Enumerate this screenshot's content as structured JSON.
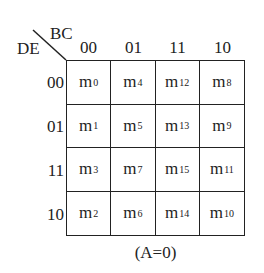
{
  "kmap": {
    "row_variable": "DE",
    "col_variable": "BC",
    "col_headers": [
      "00",
      "01",
      "11",
      "10"
    ],
    "row_headers": [
      "00",
      "01",
      "11",
      "10"
    ],
    "cells": [
      [
        {
          "base": "m",
          "sub": "0"
        },
        {
          "base": "m",
          "sub": "4"
        },
        {
          "base": "m",
          "sub": "12"
        },
        {
          "base": "m",
          "sub": "8"
        }
      ],
      [
        {
          "base": "m",
          "sub": "1"
        },
        {
          "base": "m",
          "sub": "5"
        },
        {
          "base": "m",
          "sub": "13"
        },
        {
          "base": "m",
          "sub": "9"
        }
      ],
      [
        {
          "base": "m",
          "sub": "3"
        },
        {
          "base": "m",
          "sub": "7"
        },
        {
          "base": "m",
          "sub": "15"
        },
        {
          "base": "m",
          "sub": "11"
        }
      ],
      [
        {
          "base": "m",
          "sub": "2"
        },
        {
          "base": "m",
          "sub": "6"
        },
        {
          "base": "m",
          "sub": "14"
        },
        {
          "base": "m",
          "sub": "10"
        }
      ]
    ],
    "caption": "(A=0)"
  }
}
